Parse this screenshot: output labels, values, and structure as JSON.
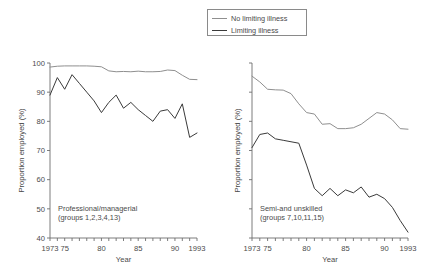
{
  "figure": {
    "width": 436,
    "height": 280,
    "background": "#ffffff",
    "axis_color": "#6e6e6e",
    "text_color": "#4a4a4a"
  },
  "legend": {
    "position": "top-center",
    "entries": [
      {
        "label": "No limiting illness",
        "color": "#8f8f8f",
        "swatch": "line-swatch"
      },
      {
        "label": "Limiting illness",
        "color": "#3a3a3a",
        "swatch": "line-swatch"
      }
    ]
  },
  "chart_data": [
    {
      "type": "line",
      "title": "",
      "panel_label": "Professional/managerial",
      "panel_sublabel": "(groups 1,2,3,4,13)",
      "xlabel": "Year",
      "ylabel": "Proportion employed (%)",
      "xlim": [
        1973,
        1993
      ],
      "ylim": [
        40,
        100
      ],
      "grid": false,
      "yticks": [
        40,
        50,
        60,
        70,
        80,
        90,
        100
      ],
      "ytick_labels": [
        "40",
        "50",
        "60",
        "70",
        "80",
        "90",
        "100"
      ],
      "xticks": [
        1973,
        1974,
        1975,
        1976,
        1977,
        1978,
        1979,
        1980,
        1981,
        1982,
        1983,
        1984,
        1985,
        1986,
        1987,
        1988,
        1989,
        1990,
        1991,
        1992,
        1993
      ],
      "xtick_labels": [
        {
          "x": 1973,
          "label": "1973"
        },
        {
          "x": 1975,
          "label": "75"
        },
        {
          "x": 1980,
          "label": "80"
        },
        {
          "x": 1985,
          "label": "85"
        },
        {
          "x": 1990,
          "label": "90"
        },
        {
          "x": 1993,
          "label": "1993"
        }
      ],
      "x": [
        1973,
        1974,
        1975,
        1976,
        1977,
        1978,
        1979,
        1980,
        1981,
        1982,
        1983,
        1984,
        1985,
        1986,
        1987,
        1988,
        1989,
        1990,
        1991,
        1992,
        1993
      ],
      "series": [
        {
          "name": "No limiting illness",
          "color": "#8f8f8f",
          "values": [
            98.6,
            98.9,
            99.0,
            99.0,
            99.0,
            99.0,
            98.9,
            98.7,
            97.3,
            97.0,
            97.1,
            97.0,
            97.2,
            97.0,
            97.0,
            97.1,
            97.6,
            97.4,
            95.8,
            94.4,
            94.3
          ]
        },
        {
          "name": "Limiting illness",
          "color": "#3a3a3a",
          "values": [
            89.0,
            95.0,
            91.0,
            96.0,
            93.0,
            90.0,
            87.0,
            83.0,
            86.5,
            89.0,
            84.5,
            86.5,
            84.0,
            82.0,
            80.0,
            83.5,
            84.0,
            81.0,
            86.0,
            74.5,
            76.0
          ]
        }
      ]
    },
    {
      "type": "line",
      "title": "",
      "panel_label": "Semi-and unskilled",
      "panel_sublabel": "(groups 7,10,11,15)",
      "xlabel": "Year",
      "ylabel": "Proportion employed (%)",
      "xlim": [
        1973,
        1993
      ],
      "ylim": [
        40,
        100
      ],
      "grid": false,
      "yticks": [
        40,
        50,
        60,
        70,
        80,
        90,
        100
      ],
      "ytick_labels": [
        "",
        "",
        "",
        "",
        "",
        "",
        ""
      ],
      "xticks": [
        1973,
        1974,
        1975,
        1976,
        1977,
        1978,
        1979,
        1980,
        1981,
        1982,
        1983,
        1984,
        1985,
        1986,
        1987,
        1988,
        1989,
        1990,
        1991,
        1992,
        1993
      ],
      "xtick_labels": [
        {
          "x": 1973,
          "label": "1973"
        },
        {
          "x": 1975,
          "label": "75"
        },
        {
          "x": 1980,
          "label": "80"
        },
        {
          "x": 1985,
          "label": "85"
        },
        {
          "x": 1990,
          "label": "90"
        },
        {
          "x": 1993,
          "label": "1993"
        }
      ],
      "x": [
        1973,
        1974,
        1975,
        1976,
        1977,
        1978,
        1979,
        1980,
        1981,
        1982,
        1983,
        1984,
        1985,
        1986,
        1987,
        1988,
        1989,
        1990,
        1991,
        1992,
        1993
      ],
      "series": [
        {
          "name": "No limiting illness",
          "color": "#8f8f8f",
          "values": [
            95.5,
            93.5,
            91.0,
            90.8,
            90.7,
            89.5,
            86.0,
            83.0,
            82.5,
            79.0,
            79.2,
            77.5,
            77.5,
            77.8,
            79.0,
            81.0,
            83.0,
            82.5,
            80.5,
            77.5,
            77.3
          ]
        },
        {
          "name": "Limiting illness",
          "color": "#3a3a3a",
          "values": [
            71.0,
            75.5,
            76.0,
            74.0,
            73.5,
            73.0,
            72.5,
            65.0,
            57.0,
            54.5,
            57.0,
            54.5,
            56.5,
            55.5,
            57.5,
            54.0,
            55.0,
            53.5,
            50.5,
            46.0,
            42.0
          ]
        }
      ]
    }
  ]
}
